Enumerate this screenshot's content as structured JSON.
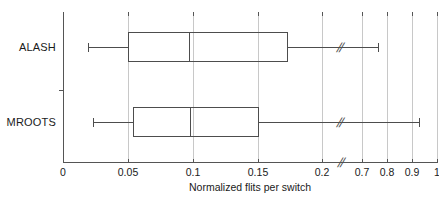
{
  "chart_data": {
    "type": "boxplot",
    "title": "",
    "xlabel": "Normalized flits per switch",
    "ylabel": "",
    "orientation": "horizontal",
    "grid": true,
    "axis_break": {
      "present": true,
      "symbol": "//",
      "between": [
        0.2,
        0.7
      ]
    },
    "x_ticks": [
      {
        "label": "0",
        "value": 0.0,
        "px": 63
      },
      {
        "label": "0.05",
        "value": 0.05,
        "px": 128
      },
      {
        "label": "0.1",
        "value": 0.1,
        "px": 193
      },
      {
        "label": "0.15",
        "value": 0.15,
        "px": 258
      },
      {
        "label": "0.2",
        "value": 0.2,
        "px": 322
      },
      {
        "label": "0.7",
        "value": 0.7,
        "px": 362
      },
      {
        "label": "0.8",
        "value": 0.8,
        "px": 387
      },
      {
        "label": "0.9",
        "value": 0.9,
        "px": 412
      },
      {
        "label": "1",
        "value": 1.0,
        "px": 437
      }
    ],
    "categories": [
      "ALASH",
      "MROOTS"
    ],
    "boxes": [
      {
        "name": "ALASH",
        "row_center_px": 47,
        "whisker_low": 0.019,
        "whisker_low_px": 88,
        "q1": 0.05,
        "q1_px": 128,
        "median": 0.097,
        "median_px": 189,
        "q3": 0.173,
        "q3_px": 288,
        "whisker_high": 0.8,
        "whisker_high_px": 378,
        "break_px": 340
      },
      {
        "name": "MROOTS",
        "row_center_px": 122,
        "whisker_low": 0.023,
        "whisker_low_px": 93,
        "q1": 0.054,
        "q1_px": 133,
        "median": 0.098,
        "median_px": 190,
        "q3": 0.151,
        "q3_px": 259,
        "whisker_high": 1.0,
        "whisker_high_px": 419,
        "break_px": 340
      }
    ]
  },
  "axis": {
    "x_break_symbol": "//",
    "left_px": 63,
    "top_px": 15,
    "bottom_px": 162
  },
  "colors": {
    "grid": "#c8c8c8",
    "axis": "#555555",
    "box_stroke": "#4d4d4d",
    "text": "#1a1a1a",
    "background": "#ffffff"
  }
}
